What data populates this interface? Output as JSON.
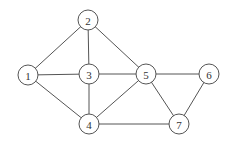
{
  "graph": {
    "node_radius": 10,
    "nodes": [
      {
        "id": "1",
        "label": "1",
        "x": 28,
        "y": 75
      },
      {
        "id": "2",
        "label": "2",
        "x": 88,
        "y": 20
      },
      {
        "id": "3",
        "label": "3",
        "x": 89,
        "y": 74
      },
      {
        "id": "4",
        "label": "4",
        "x": 89,
        "y": 124
      },
      {
        "id": "5",
        "label": "5",
        "x": 146,
        "y": 74
      },
      {
        "id": "6",
        "label": "6",
        "x": 209,
        "y": 74
      },
      {
        "id": "7",
        "label": "7",
        "x": 179,
        "y": 124
      }
    ],
    "edges": [
      [
        "1",
        "2"
      ],
      [
        "1",
        "3"
      ],
      [
        "1",
        "4"
      ],
      [
        "2",
        "3"
      ],
      [
        "2",
        "5"
      ],
      [
        "3",
        "4"
      ],
      [
        "3",
        "5"
      ],
      [
        "4",
        "5"
      ],
      [
        "4",
        "7"
      ],
      [
        "5",
        "6"
      ],
      [
        "5",
        "7"
      ],
      [
        "6",
        "7"
      ]
    ]
  }
}
